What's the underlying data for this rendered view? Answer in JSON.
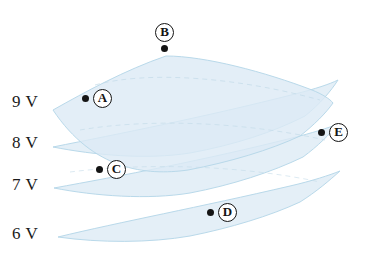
{
  "figure": {
    "background_color": "#ffffff",
    "sheet_fill_color": "#dceaf5",
    "sheet_edge_color": "#b9d9ea",
    "marker_color": "#141414",
    "label_color": "#1b1b1b"
  },
  "voltage_labels": [
    {
      "id": "9v",
      "text": "9 V",
      "sheet_index": 0
    },
    {
      "id": "8v",
      "text": "8 V",
      "sheet_index": 1
    },
    {
      "id": "7v",
      "text": "7 V",
      "sheet_index": 2
    },
    {
      "id": "6v",
      "text": "6 V",
      "sheet_index": 3
    }
  ],
  "markers": [
    {
      "id": "A",
      "letter": "A",
      "on_sheet": "9 V",
      "dot_side": "left"
    },
    {
      "id": "B",
      "letter": "B",
      "on_sheet": "9 V",
      "dot_side": "below"
    },
    {
      "id": "C",
      "letter": "C",
      "on_sheet": "7 V",
      "dot_side": "left"
    },
    {
      "id": "D",
      "letter": "D",
      "on_sheet": "6 V",
      "dot_side": "left"
    },
    {
      "id": "E",
      "letter": "E",
      "on_sheet": "8 V",
      "dot_side": "left"
    }
  ],
  "sheets": [
    {
      "id": "sheet-9v",
      "label": "9 V",
      "opacity": 0.72
    },
    {
      "id": "sheet-8v",
      "label": "8 V",
      "opacity": 0.72
    },
    {
      "id": "sheet-7v",
      "label": "7 V",
      "opacity": 0.72
    },
    {
      "id": "sheet-6v",
      "label": "6 V",
      "opacity": 0.72
    }
  ]
}
